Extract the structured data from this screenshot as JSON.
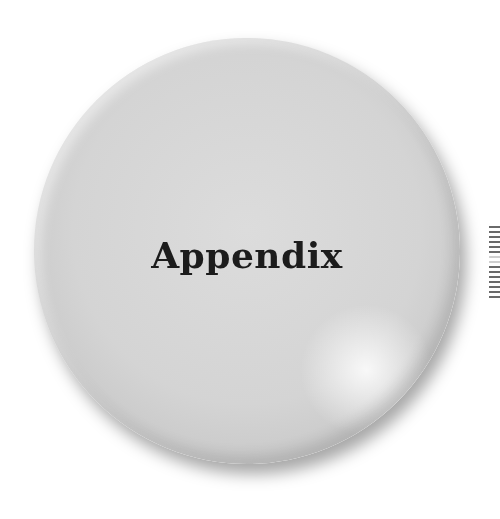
{
  "page": {
    "heading": "Appendix"
  },
  "decor": {
    "disc_color": "#d6d6d6",
    "text_color": "#1c1c1c",
    "edge_marks": [
      "dark",
      "dark",
      "dark",
      "dark",
      "dark",
      "dark",
      "light",
      "light",
      "dark",
      "dark",
      "dark",
      "dark",
      "dark",
      "dark",
      "dark",
      "dark"
    ]
  }
}
